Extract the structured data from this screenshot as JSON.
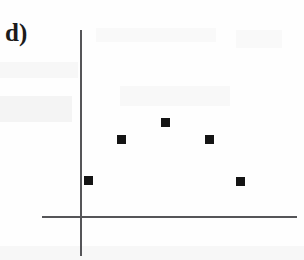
{
  "figure": {
    "panel_label": "d)",
    "width": 304,
    "height": 260,
    "background_color": "#fefefe",
    "axis_color": "#555558",
    "marker_color": "#141414"
  },
  "chart_data": {
    "type": "scatter",
    "title": "d)",
    "xlabel": "",
    "ylabel": "",
    "grid": false,
    "legend": null,
    "axes": {
      "y_axis_x_px": 81,
      "y_axis_top_px": 30,
      "y_axis_bottom_px": 256,
      "x_axis_y_px": 217,
      "x_axis_left_px": 42,
      "x_axis_right_px": 297,
      "tick_labels_x": [],
      "tick_labels_y": [],
      "xlim": [
        0,
        6
      ],
      "ylim": [
        0,
        5
      ]
    },
    "categories": [
      "1",
      "2",
      "3",
      "4",
      "5"
    ],
    "x": [
      1,
      2,
      3,
      4,
      5
    ],
    "values": [
      1.0,
      2.4,
      3.0,
      2.4,
      0.95
    ],
    "points": [
      {
        "index": 1,
        "x": 1,
        "y": 1.0,
        "px": 88,
        "py": 180
      },
      {
        "index": 2,
        "x": 2,
        "y": 2.4,
        "px": 121,
        "py": 139
      },
      {
        "index": 3,
        "x": 3,
        "y": 3.0,
        "px": 165,
        "py": 122
      },
      {
        "index": 4,
        "x": 4,
        "y": 2.4,
        "px": 209,
        "py": 139
      },
      {
        "index": 5,
        "x": 5,
        "y": 0.95,
        "px": 240,
        "py": 181
      }
    ],
    "marker_style": "filled-square",
    "marker_size_px": 9
  }
}
